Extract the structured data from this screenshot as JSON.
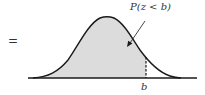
{
  "diagram": {
    "equals": "=",
    "probability_label": "P(z < b)",
    "boundary_label": "b",
    "colors": {
      "curve": "#1a1a1a",
      "shade": "#dcdcdc",
      "axis": "#1a1a1a",
      "text": "#333333"
    }
  }
}
